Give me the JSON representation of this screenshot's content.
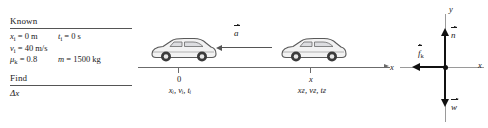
{
  "known": {
    "title": "Known",
    "rows": [
      [
        {
          "sym": "x",
          "sub": "i",
          "rest": " = 0 m"
        },
        {
          "sym": "t",
          "sub": "i",
          "rest": " = 0 s"
        }
      ],
      [
        {
          "sym": "v",
          "sub": "i",
          "rest": " = 40 m/s"
        }
      ],
      [
        {
          "sym": "μ",
          "sub": "k",
          "rest": " = 0.8"
        },
        {
          "sym": "m",
          "sub": "",
          "rest": " = 1500 kg"
        }
      ]
    ]
  },
  "find": {
    "title": "Find",
    "value": "Δx"
  },
  "motion": {
    "axis_label": "x",
    "acceleration_label": "a",
    "initial": {
      "position_number": "0",
      "variables": "xᵢ, vᵢ, tᵢ"
    },
    "final": {
      "position_number": "x",
      "variables": "xғ, vғ, tғ"
    },
    "car_count": 2,
    "car_color": "#e8e8e8"
  },
  "free_body": {
    "y_axis_label": "y",
    "x_axis_label": "x",
    "vectors": [
      {
        "name": "normal-force",
        "label": "n",
        "direction": "up"
      },
      {
        "name": "kinetic-friction",
        "label": "f",
        "sub": "k",
        "direction": "left"
      },
      {
        "name": "weight",
        "label": "w",
        "direction": "down"
      }
    ]
  },
  "colors": {
    "ink": "#1a1a1a",
    "rule": "#555555",
    "ground": "#6b6b6b",
    "axis": "#9a9a9a",
    "vector": "#111111"
  }
}
